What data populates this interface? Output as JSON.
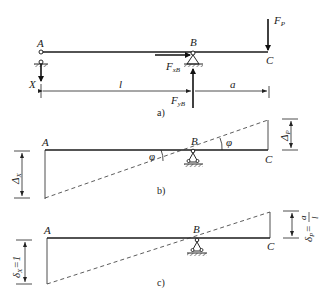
{
  "figure": {
    "panels": [
      {
        "id": "a",
        "caption": "a)",
        "points": {
          "A": "A",
          "B": "B",
          "C": "C"
        },
        "forces": {
          "FP": {
            "main": "F",
            "sub": "P"
          },
          "FxB": {
            "main": "F",
            "sub": "xB"
          },
          "FyB": {
            "main": "F",
            "sub": "yB"
          },
          "X": "X"
        },
        "dimensions": {
          "AB": "l",
          "BC": "a"
        }
      },
      {
        "id": "b",
        "caption": "b)",
        "points": {
          "A": "A",
          "B": "B",
          "C": "C"
        },
        "angles": {
          "left": "φ",
          "right": "φ"
        },
        "dimensions": {
          "left": {
            "main": "Δ",
            "sub": "X"
          },
          "right": {
            "main": "Δ",
            "sub": "P"
          }
        }
      },
      {
        "id": "c",
        "caption": "c)",
        "points": {
          "A": "A",
          "B": "B",
          "C": "C"
        },
        "dimensions": {
          "left": {
            "main": "δ",
            "sub": "X",
            "value": "=1"
          },
          "right": {
            "main": "δ",
            "sub": "P",
            "value": "=",
            "num": "a",
            "den": "l"
          }
        }
      }
    ]
  }
}
